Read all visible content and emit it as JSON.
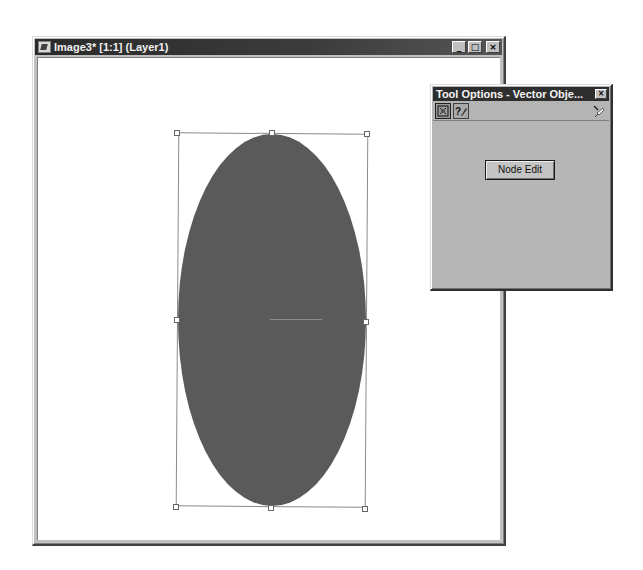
{
  "image_window": {
    "title": "Image3* [1:1] (Layer1)",
    "icon": "image-document-icon",
    "buttons": {
      "minimize": "_",
      "maximize": "□",
      "close": "×"
    },
    "canvas": {
      "object": "ellipse",
      "fill_color": "#5a5a5a",
      "selection_handles": 8
    }
  },
  "tool_options": {
    "title": "Tool Options - Vector Obje...",
    "close": "×",
    "tabs": [
      {
        "icon": "vector-object-tool-icon",
        "active": true
      },
      {
        "icon": "help-pen-icon",
        "active": false
      }
    ],
    "pin_icon": "pushpin-icon",
    "node_edit_label": "Node Edit"
  }
}
